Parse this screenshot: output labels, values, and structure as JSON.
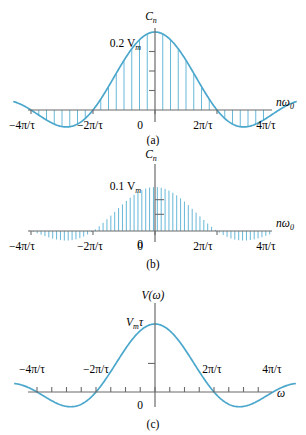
{
  "figure": {
    "title": "",
    "background": "#ffffff",
    "curve_color": "#4ba7cc",
    "stem_color": "#68b8d8",
    "axis_color": "#6b6b6b"
  },
  "panels": [
    {
      "id": "a",
      "caption": "(a)",
      "y_axis_label": "Cn",
      "y_axis_label_main": "C",
      "y_axis_label_sub": "n",
      "x_axis_label_main": "nω",
      "x_axis_label_sub": "0",
      "peak_label": "0.2 V",
      "peak_label_sub": "m",
      "origin_label": "0",
      "x_ticks": [
        {
          "label": "−4π/τ",
          "value": -4
        },
        {
          "label": "−2π/τ",
          "value": -2
        },
        {
          "label": "0",
          "value": 0
        },
        {
          "label": "2π/τ",
          "value": 2
        },
        {
          "label": "4π/τ",
          "value": 4
        }
      ],
      "y_tick_count": 3,
      "stem_spacing_units": 0.25,
      "envelope": "sinc"
    },
    {
      "id": "b",
      "caption": "(b)",
      "y_axis_label_main": "C",
      "y_axis_label_sub": "n",
      "x_axis_label_main": "nω",
      "x_axis_label_sub": "0",
      "peak_label": "0.1 V",
      "peak_label_sub": "m",
      "origin_label": "0",
      "x_ticks": [
        {
          "label": "−4π/τ",
          "value": -4
        },
        {
          "label": "−2π/τ",
          "value": -2
        },
        {
          "label": "0",
          "value": 0
        },
        {
          "label": "2π/τ",
          "value": 2
        },
        {
          "label": "4π/τ",
          "value": 4
        }
      ],
      "y_tick_count": 2,
      "stem_spacing_units": 0.125,
      "envelope": "sinc"
    },
    {
      "id": "c",
      "caption": "(c)",
      "y_axis_label": "V(ω)",
      "x_axis_label": "ω",
      "peak_label_main": "V",
      "peak_label_sub": "m",
      "peak_label_tail": "τ",
      "origin_label": "0",
      "x_ticks": [
        {
          "label": "−4π/τ",
          "value": -4
        },
        {
          "label": "−2π/τ",
          "value": -2
        },
        {
          "label": "2π/τ",
          "value": 2
        },
        {
          "label": "4π/τ",
          "value": 4
        }
      ],
      "y_tick_count": 1,
      "envelope": "sinc"
    }
  ],
  "chart_data": {
    "type": "line",
    "xlabel": "nω₀",
    "ylabel": "Cₙ",
    "subplots": [
      {
        "id": "a",
        "caption": "(a)",
        "type": "line",
        "xlabel": "nω₀",
        "ylabel": "Cₙ",
        "peak_value_label": "0.2 Vₘ",
        "xlim": [
          -4.6,
          4.6
        ],
        "ylim": [
          -0.06,
          0.215
        ],
        "xtick_labels": [
          "−4π/τ",
          "−2π/τ",
          "0",
          "2π/τ",
          "4π/τ"
        ],
        "xtick_values": [
          -4,
          -2,
          0,
          2,
          4
        ],
        "ytick_count": 3,
        "function": "0.2*Vm*sinc(x/2)",
        "stem_spacing": 0.25,
        "grid": false,
        "legend": "none"
      },
      {
        "id": "b",
        "caption": "(b)",
        "type": "line",
        "xlabel": "nω₀",
        "ylabel": "Cₙ",
        "peak_value_label": "0.1 Vₘ",
        "xlim": [
          -4.6,
          4.6
        ],
        "ylim": [
          -0.03,
          0.11
        ],
        "xtick_labels": [
          "−4π/τ",
          "−2π/τ",
          "0",
          "2π/τ",
          "4π/τ"
        ],
        "xtick_values": [
          -4,
          -2,
          0,
          2,
          4
        ],
        "ytick_count": 2,
        "function": "0.1*Vm*sinc(x/2)",
        "stem_spacing": 0.125,
        "grid": false,
        "legend": "none"
      },
      {
        "id": "c",
        "caption": "(c)",
        "type": "line",
        "xlabel": "ω",
        "ylabel": "V(ω)",
        "peak_value_label": "Vₘτ",
        "xlim": [
          -4.8,
          4.8
        ],
        "ylim": [
          -0.3,
          1.05
        ],
        "xtick_labels": [
          "−4π/τ",
          "−2π/τ",
          "2π/τ",
          "4π/τ"
        ],
        "xtick_values": [
          -4,
          -2,
          2,
          4
        ],
        "ytick_count": 1,
        "function": "Vm*τ*sinc(ωτ/2)",
        "grid": false,
        "legend": "none"
      }
    ]
  }
}
